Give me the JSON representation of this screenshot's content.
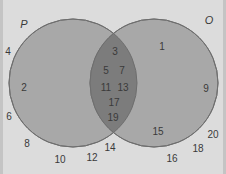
{
  "diagram": {
    "type": "venn",
    "colors": {
      "background": "#dcdcdc",
      "circle_fill": "#a8a8a8",
      "intersection_fill": "#7c7c7c",
      "circle_stroke": "#6e6e6e",
      "text": "#3a3a3a"
    },
    "sets": [
      {
        "id": "P",
        "label": "P",
        "cx": 73,
        "cy": 83,
        "r": 64,
        "label_pos": [
          24,
          24
        ]
      },
      {
        "id": "O",
        "label": "O",
        "cx": 154,
        "cy": 83,
        "r": 64,
        "label_pos": [
          209,
          20
        ]
      }
    ],
    "regions": {
      "P_only": [
        {
          "value": "2",
          "pos": [
            24,
            88
          ]
        }
      ],
      "P_and_O": [
        {
          "value": "3",
          "pos": [
            115,
            52
          ]
        },
        {
          "value": "5",
          "pos": [
            106,
            71
          ]
        },
        {
          "value": "7",
          "pos": [
            122,
            71
          ]
        },
        {
          "value": "11",
          "pos": [
            106,
            88
          ]
        },
        {
          "value": "13",
          "pos": [
            123,
            88
          ]
        },
        {
          "value": "17",
          "pos": [
            114,
            103
          ]
        },
        {
          "value": "19",
          "pos": [
            113,
            118
          ]
        }
      ],
      "O_only": [
        {
          "value": "1",
          "pos": [
            162,
            47
          ]
        },
        {
          "value": "9",
          "pos": [
            206,
            89
          ]
        },
        {
          "value": "15",
          "pos": [
            158,
            132
          ]
        }
      ],
      "outside": [
        {
          "value": "4",
          "pos": [
            8,
            52
          ]
        },
        {
          "value": "6",
          "pos": [
            9,
            117
          ]
        },
        {
          "value": "8",
          "pos": [
            27,
            144
          ]
        },
        {
          "value": "10",
          "pos": [
            60,
            160
          ]
        },
        {
          "value": "12",
          "pos": [
            92,
            158
          ]
        },
        {
          "value": "14",
          "pos": [
            110,
            148
          ]
        },
        {
          "value": "16",
          "pos": [
            172,
            159
          ]
        },
        {
          "value": "18",
          "pos": [
            198,
            149
          ]
        },
        {
          "value": "20",
          "pos": [
            213,
            135
          ]
        }
      ]
    }
  }
}
